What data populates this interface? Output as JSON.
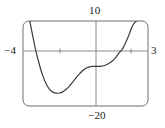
{
  "figure": {
    "kind": "graphing-calculator-window",
    "title": "",
    "frame": {
      "x_min": 23,
      "x_max": 148,
      "y_min": 21,
      "y_max": 106,
      "corner_radius": 6
    },
    "labels": {
      "top": "10",
      "bottom": "−20",
      "left": "−4",
      "right": "3"
    },
    "colors": {
      "curve": "#3a3a3a",
      "axis": "#8a8a8a",
      "frame": "#6e6e6e",
      "text": "#1a1a1a",
      "background": "#ffffff"
    }
  },
  "chart_data": {
    "type": "line",
    "title": "",
    "xlabel": "",
    "ylabel": "",
    "xlim": [
      -4,
      3
    ],
    "ylim": [
      -20,
      10
    ],
    "grid": false,
    "legend": null,
    "axes": {
      "x_axis_label_left": "−4",
      "x_axis_label_right": "3",
      "y_axis_label_top": "10",
      "y_axis_label_bottom": "−20",
      "x_tick_values": [
        -2,
        0,
        2
      ],
      "y_tick_values": [
        0
      ],
      "x_axis_at_y": 0,
      "y_axis_at_x": 0
    },
    "annotations": [
      {
        "kind": "local-minimum",
        "x": -1.95,
        "y": -15.4
      },
      {
        "kind": "saddle-plateau",
        "x": -0.1,
        "y": -6.0
      },
      {
        "kind": "x-intercept",
        "x": -3.3,
        "y": 0
      },
      {
        "kind": "x-intercept",
        "x": 1.55,
        "y": 0
      }
    ],
    "series": [
      {
        "name": "curve",
        "x": [
          -3.62,
          -3.5,
          -3.3,
          -3.1,
          -2.9,
          -2.7,
          -2.5,
          -2.3,
          -2.1,
          -1.95,
          -1.8,
          -1.6,
          -1.4,
          -1.2,
          -1.0,
          -0.8,
          -0.6,
          -0.4,
          -0.2,
          -0.1,
          0.0,
          0.2,
          0.4,
          0.6,
          0.8,
          1.0,
          1.2,
          1.4,
          1.55,
          1.7,
          1.85,
          2.0,
          2.1,
          2.2,
          2.35
        ],
        "y": [
          10.0,
          6.2,
          0.0,
          -5.0,
          -9.2,
          -12.2,
          -14.2,
          -15.2,
          -15.5,
          -15.4,
          -15.1,
          -14.2,
          -13.0,
          -11.4,
          -9.8,
          -8.4,
          -7.2,
          -6.4,
          -6.05,
          -6.0,
          -6.0,
          -6.0,
          -5.9,
          -5.6,
          -5.0,
          -4.1,
          -2.8,
          -1.1,
          0.0,
          1.7,
          3.8,
          6.2,
          7.9,
          9.0,
          10.0
        ]
      }
    ]
  }
}
